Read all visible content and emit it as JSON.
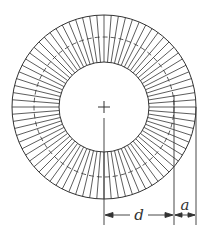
{
  "figure": {
    "type": "annular washer / ring with radial serrations",
    "center": {
      "x": 104,
      "y": 107
    },
    "outer_radius": 92,
    "mid_radius_dashed": 70,
    "inner_radius": 45,
    "radial_line_count": 80,
    "stroke_color": "#333333",
    "center_mark": "+"
  },
  "dimensions": {
    "d": {
      "label": "d",
      "from": "center",
      "to": "mid-circle"
    },
    "a": {
      "label": "a",
      "from": "mid-circle",
      "to": "outer-circle"
    }
  }
}
